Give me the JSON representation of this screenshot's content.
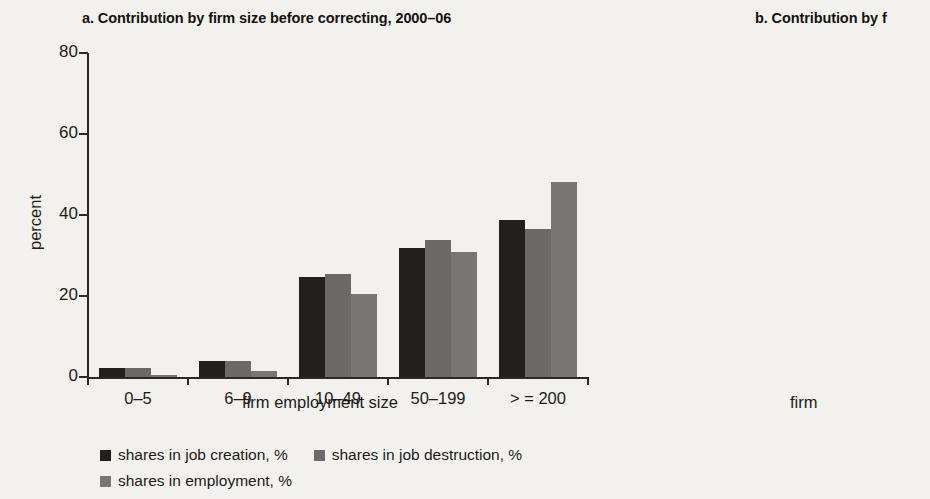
{
  "figure": {
    "background": "#f2f1ee",
    "series_colors": {
      "job_creation": "#231f1e",
      "job_destruction": "#6b6a68",
      "employment": "#787775"
    }
  },
  "panel_a": {
    "title": "a.  Contribution by firm size before correcting, 2000–06",
    "ylabel": "percent",
    "xlabel": "firm employment size",
    "legend": [
      "shares in job creation, %",
      "shares in job destruction, %",
      "shares in employment, %"
    ]
  },
  "panel_b": {
    "title": "b.  Contribution by f",
    "ylabel": "percent",
    "xlabel": "firm",
    "legend": [
      "shares in job creatio",
      "shares in employme"
    ]
  },
  "chart_data": [
    {
      "type": "bar",
      "title": "a.  Contribution by firm size before correcting, 2000–06",
      "xlabel": "firm employment size",
      "ylabel": "percent",
      "ylim": [
        0,
        80
      ],
      "yticks": [
        0,
        20,
        40,
        60,
        80
      ],
      "ytick_labels": [
        "0",
        "20",
        "40",
        "60",
        "80"
      ],
      "grid": false,
      "legend_position": "bottom-left",
      "categories": [
        "0–5",
        "6–9",
        "10–49",
        "50–199",
        "> = 200"
      ],
      "series": [
        {
          "name": "shares in job creation, %",
          "color": "#231f1e",
          "values": [
            2.2,
            4.0,
            24.7,
            31.8,
            38.7
          ]
        },
        {
          "name": "shares in job destruction, %",
          "color": "#6b6a68",
          "values": [
            2.2,
            4.0,
            25.4,
            33.8,
            36.5
          ]
        },
        {
          "name": "shares in employment, %",
          "color": "#787775",
          "values": [
            0.5,
            1.5,
            20.4,
            30.8,
            48.2
          ]
        }
      ]
    },
    {
      "type": "bar",
      "title": "b.  Contribution by f",
      "xlabel": "firm",
      "ylabel": "percent",
      "ylim": [
        0,
        80
      ],
      "yticks": [
        0,
        20,
        40,
        60,
        80
      ],
      "ytick_labels": [
        "0",
        "20",
        "40",
        "60",
        "80"
      ],
      "grid": false,
      "legend_position": "bottom-left",
      "note": "panel cropped at right edge of screenshot",
      "categories": [
        "0–5",
        "6–9"
      ],
      "series": [
        {
          "name": "shares in job creation, %",
          "color": "#231f1e",
          "values": [
            71.5,
            9.0
          ]
        },
        {
          "name": "shares in job destruction, %",
          "color": "#6b6a68",
          "values": [
            70.0,
            9.8
          ]
        },
        {
          "name": "shares in employment, %",
          "color": "#787775",
          "values": [
            40.5,
            8.5
          ]
        }
      ]
    }
  ]
}
